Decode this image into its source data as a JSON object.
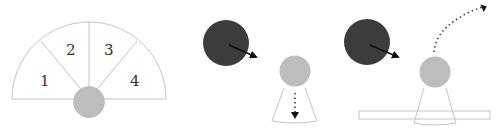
{
  "figure": {
    "panels": [
      {
        "id": "sector-layout",
        "sector_labels": [
          "1",
          "2",
          "3",
          "4"
        ]
      },
      {
        "id": "occluder-falling",
        "arrows": [
          "solid-arrow",
          "dotted-arrow-down"
        ]
      },
      {
        "id": "occluder-deflect",
        "arrows": [
          "solid-arrow",
          "dotted-arc-arrow-up-right"
        ]
      }
    ],
    "colors": {
      "dark_ball": "#3c3c3c",
      "light_ball": "#bdbdbd",
      "outline": "#bfbfbf",
      "arrow": "#111111"
    }
  }
}
